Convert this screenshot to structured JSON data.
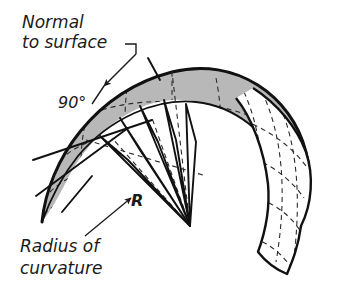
{
  "figure": {
    "background_color": "#ffffff",
    "ink_color": "#1a1a1a",
    "surface_fill": "#b8b8b8",
    "band_fill": "#ffffff",
    "wedge_fill": "#ffffff",
    "labels": {
      "normal_line1": "Normal",
      "normal_line2": "to surface",
      "angle": "90°",
      "radius_symbol": "R",
      "radius_line1": "Radius of",
      "radius_line2": "curvature"
    },
    "annotations": {
      "normal_to_surface": "Normal to surface",
      "right_angle": "90°",
      "radius_of_curvature": "Radius of curvature"
    }
  }
}
